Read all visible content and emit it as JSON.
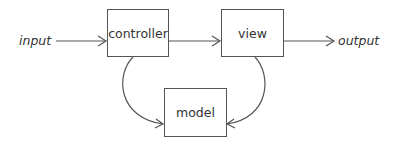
{
  "diagram": {
    "nodes": {
      "controller": {
        "label": "controller"
      },
      "view": {
        "label": "view"
      },
      "model": {
        "label": "model"
      }
    },
    "input_label": "input",
    "output_label": "output",
    "edges": [
      {
        "from": "input",
        "to": "controller"
      },
      {
        "from": "controller",
        "to": "view"
      },
      {
        "from": "view",
        "to": "output"
      },
      {
        "from": "controller",
        "to": "model"
      },
      {
        "from": "view",
        "to": "model"
      }
    ],
    "colors": {
      "stroke": "#555555",
      "text": "#333333"
    }
  }
}
